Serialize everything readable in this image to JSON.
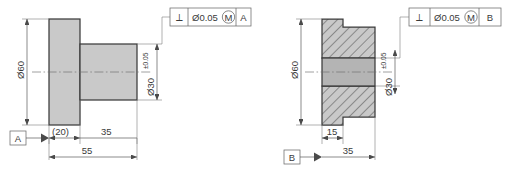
{
  "drawing": {
    "title": "Perpendicularity GD&T comparison – shaft and bore",
    "units": "mm",
    "colors": {
      "part_fill": "#c9c9c9",
      "bore_fill": "#b4b4b4",
      "outline": "#3b3b3b",
      "dimension_line": "#5a5a5a",
      "text": "#3a3a3a"
    }
  },
  "left_view": {
    "name": "shaft-outline-view",
    "datum_label": "A",
    "dimensions": {
      "flange_diameter": "Ø60",
      "shaft_diameter": "Ø30",
      "shaft_tolerance": "±0.05",
      "flange_length": "(20)",
      "shaft_length": "35",
      "overall_length": "55"
    },
    "fcf": {
      "symbol": "⟂",
      "symbol_name": "perpendicularity-symbol",
      "tolerance": "Ø0.05",
      "modifier": "M",
      "datum": "A"
    }
  },
  "right_view": {
    "name": "bore-section-view",
    "datum_label": "B",
    "dimensions": {
      "outer_diameter": "Ø60",
      "bore_diameter": "Ø30",
      "bore_tolerance": "±0.05",
      "step_length": "15",
      "overall_length": "35"
    },
    "fcf": {
      "symbol": "⟂",
      "symbol_name": "perpendicularity-symbol",
      "tolerance": "Ø0.05",
      "modifier": "M",
      "datum": "B"
    }
  }
}
